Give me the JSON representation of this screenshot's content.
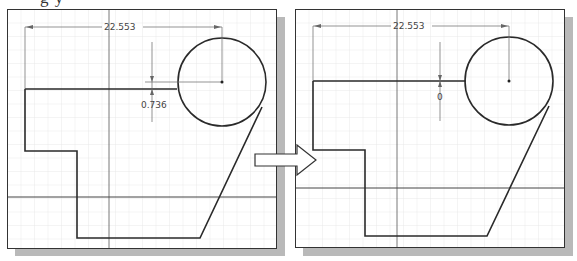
{
  "caption": {
    "partial_text": "g                y"
  },
  "left_panel": {
    "title": "before",
    "horizontal_dimension": "22.553",
    "vertical_dimension": "0.736"
  },
  "right_panel": {
    "title": "after",
    "horizontal_dimension": "22.553",
    "vertical_dimension": "0"
  },
  "transition_arrow": {
    "icon": "right-arrow-icon"
  },
  "colors": {
    "frame": "#333333",
    "profile": "#2a2a2a",
    "grid": "#e3e3e3",
    "dimension": "#666666",
    "shadow": "#b9b9b9"
  }
}
